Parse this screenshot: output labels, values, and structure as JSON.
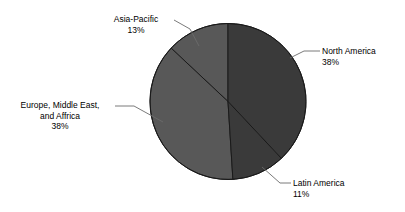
{
  "chart_data": {
    "type": "pie",
    "title": "",
    "subtitle": "",
    "xlabel": "",
    "ylabel": "",
    "legend_position": "none",
    "grid": false,
    "labels_on_slices": false,
    "label_style": "external-with-leader-lines",
    "start_angle_deg": 0,
    "direction": "clockwise",
    "categories": [
      "North America",
      "Latin America",
      "Europe, Middle East, and Affrica",
      "Asia-Pacific"
    ],
    "values": [
      38,
      11,
      38,
      13
    ],
    "value_suffix": "%",
    "slices": [
      {
        "name": "North America",
        "label_line_1": "North America",
        "label_line_2": "38%",
        "value": 38,
        "percent_text": "38%",
        "color": "#3a3a3a"
      },
      {
        "name": "Latin America",
        "label_line_1": "Latin America",
        "label_line_2": "11%",
        "value": 11,
        "percent_text": "11%",
        "color": "#3a3a3a"
      },
      {
        "name": "Europe, Middle East, and Affrica",
        "label_line_1": "Europe, Middle East,",
        "label_line_2": "and Affrica",
        "label_line_3": "38%",
        "value": 38,
        "percent_text": "38%",
        "color": "#585858"
      },
      {
        "name": "Asia-Pacific",
        "label_line_1": "Asia-Pacific",
        "label_line_2": "13%",
        "value": 13,
        "percent_text": "13%",
        "color": "#585858"
      }
    ]
  },
  "colors": {
    "background": "#ffffff",
    "dark_slice": "#3a3a3a",
    "medium_slice": "#585858",
    "slice_outline": "#1a1a1a",
    "leader_line": "#6b6b6b",
    "text": "#000000"
  },
  "geometry": {
    "center_x": 228,
    "center_y": 101.5,
    "radius": 78
  }
}
